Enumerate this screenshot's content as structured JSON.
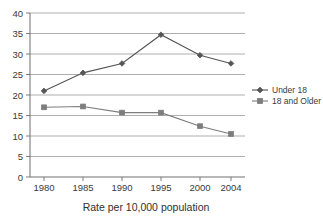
{
  "chart_data": {
    "type": "line",
    "title": "",
    "xlabel": "Rate per 10,000 population",
    "ylabel": "",
    "x": [
      "1980",
      "1985",
      "1990",
      "1995",
      "2000",
      "2004"
    ],
    "categories": [
      "1980",
      "1985",
      "1990",
      "1995",
      "2000",
      "2004"
    ],
    "xlim": [
      1978,
      2006
    ],
    "ylim": [
      0,
      40
    ],
    "y_ticks": [
      "0",
      "5",
      "10",
      "15",
      "20",
      "25",
      "30",
      "35",
      "40"
    ],
    "grid": true,
    "legend_position": "right",
    "series": [
      {
        "name": "Under 18",
        "marker": "diamond",
        "color": "#555555",
        "values": [
          21.0,
          25.4,
          27.7,
          34.7,
          29.7,
          27.7
        ]
      },
      {
        "name": "18 and Older",
        "marker": "square",
        "color": "#7d7d7d",
        "values": [
          17.0,
          17.2,
          15.7,
          15.7,
          12.4,
          10.5
        ]
      }
    ]
  },
  "axis": {
    "x_tick_labels": [
      "1980",
      "1985",
      "1990",
      "1995",
      "2000",
      "2004"
    ],
    "y_tick_labels": [
      "40",
      "35",
      "30",
      "25",
      "20",
      "15",
      "10",
      "5",
      "0"
    ]
  },
  "title": {
    "caption": "Rate per 10,000 population"
  },
  "legend": {
    "items": [
      {
        "label": "Under 18",
        "marker": "diamond-marker-icon"
      },
      {
        "label": "18 and Older",
        "marker": "square-marker-icon"
      }
    ]
  },
  "colors": {
    "series_under18": "#555555",
    "series_18older": "#7d7d7d",
    "gridline": "#9a9a9a",
    "axis": "#6e6e6e",
    "text": "#3a3a3a",
    "background": "#ffffff"
  }
}
